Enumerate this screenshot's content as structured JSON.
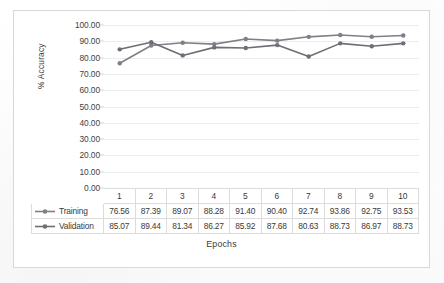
{
  "chart_data": {
    "type": "line",
    "title": "",
    "xlabel": "Epochs",
    "ylabel": "% Accuracy",
    "categories": [
      "1",
      "2",
      "3",
      "4",
      "5",
      "6",
      "7",
      "8",
      "9",
      "10"
    ],
    "ylim": [
      0,
      100
    ],
    "ytick_step": 10,
    "ytick_labels": [
      "100.00",
      "90.00",
      "80.00",
      "70.00",
      "60.00",
      "50.00",
      "40.00",
      "30.00",
      "20.00",
      "10.00",
      "0.00"
    ],
    "grid": true,
    "legend_position": "data-table-left",
    "has_data_table": true,
    "series": [
      {
        "name": "Training",
        "marker": "circle",
        "color": "#7f7f88",
        "values": [
          76.56,
          87.39,
          89.07,
          88.28,
          91.4,
          90.4,
          92.74,
          93.86,
          92.75,
          93.53
        ],
        "labels": [
          "76.56",
          "87.39",
          "89.07",
          "88.28",
          "91.40",
          "90.40",
          "92.74",
          "93.86",
          "92.75",
          "93.53"
        ]
      },
      {
        "name": "Validation",
        "marker": "circle",
        "color": "#6e6e76",
        "values": [
          85.07,
          89.44,
          81.34,
          86.27,
          85.92,
          87.68,
          80.63,
          88.73,
          86.97,
          88.73
        ],
        "labels": [
          "85.07",
          "89.44",
          "81.34",
          "86.27",
          "85.92",
          "87.68",
          "80.63",
          "88.73",
          "86.97",
          "88.73"
        ]
      }
    ]
  }
}
